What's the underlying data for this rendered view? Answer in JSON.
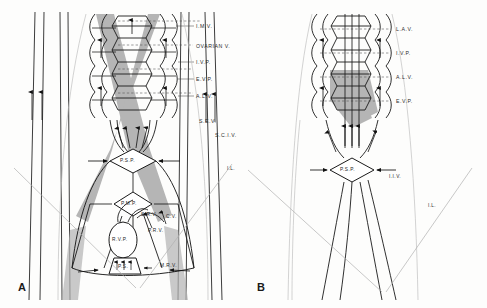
{
  "figure": {
    "background_color": "#fdfdfc",
    "line_color": "#1a1a1a",
    "shade_color": "#a8a8a8",
    "light_line_color": "#9a9a9a"
  },
  "panels": [
    {
      "id": "A",
      "letter": "A",
      "labels_right": [
        {
          "text": "I.M.V.",
          "x": 196,
          "y": 27
        },
        {
          "text": "OVARIAN V.",
          "x": 196,
          "y": 47
        },
        {
          "text": "I.V.P.",
          "x": 196,
          "y": 63
        },
        {
          "text": "E.V.P.",
          "x": 196,
          "y": 80
        },
        {
          "text": "A.L.V.",
          "x": 196,
          "y": 97
        },
        {
          "text": "S.E.V.",
          "x": 199,
          "y": 122
        },
        {
          "text": "S.C.I.V.",
          "x": 215,
          "y": 136
        },
        {
          "text": "I.L.",
          "x": 227,
          "y": 170
        }
      ],
      "inner_labels": [
        {
          "text": "P.S.P.",
          "x": 117,
          "y": 160
        },
        {
          "text": "P.M.P.",
          "x": 117,
          "y": 204
        },
        {
          "text": "S.R.V.",
          "x": 141,
          "y": 215
        },
        {
          "text": "C.V.",
          "x": 165,
          "y": 217
        },
        {
          "text": "P.R.V.",
          "x": 147,
          "y": 231
        },
        {
          "text": "R.V.P.",
          "x": 113,
          "y": 240
        },
        {
          "text": "P.S.",
          "x": 116,
          "y": 269
        },
        {
          "text": "M.R.V.",
          "x": 163,
          "y": 266
        }
      ]
    },
    {
      "id": "B",
      "letter": "B",
      "labels_right": [
        {
          "text": "L.A.V.",
          "x": 392,
          "y": 30
        },
        {
          "text": "I.V.P.",
          "x": 392,
          "y": 53
        },
        {
          "text": "A.L.V.",
          "x": 392,
          "y": 78
        },
        {
          "text": "E.V.P.",
          "x": 392,
          "y": 103
        },
        {
          "text": "I.L.",
          "x": 428,
          "y": 207
        }
      ],
      "inner_labels": [
        {
          "text": "P.S.P.",
          "x": 355,
          "y": 169
        },
        {
          "text": "I.I.V.",
          "x": 389,
          "y": 176
        }
      ]
    }
  ]
}
